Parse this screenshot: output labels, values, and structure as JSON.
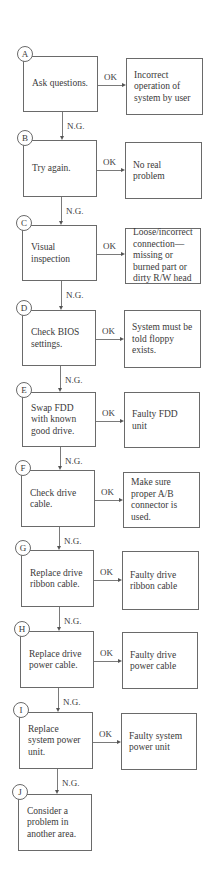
{
  "diagram": {
    "ok_label": "OK",
    "ng_label": "N.G.",
    "steps": [
      {
        "id": "A",
        "action": "Ask questions.",
        "result": "Incorrect operation of system by user"
      },
      {
        "id": "B",
        "action": "Try again.",
        "result": "No real problem"
      },
      {
        "id": "C",
        "action": "Visual inspection",
        "result": "Loose/incorrect connection—missing or burned part or dirty R/W head"
      },
      {
        "id": "D",
        "action": "Check BIOS settings.",
        "result": "System must be told floppy exists."
      },
      {
        "id": "E",
        "action": "Swap FDD with known good drive.",
        "result": "Faulty FDD unit"
      },
      {
        "id": "F",
        "action": "Check drive cable.",
        "result": "Make sure proper A/B connector is used."
      },
      {
        "id": "G",
        "action": "Replace drive ribbon cable.",
        "result": "Faulty drive ribbon cable"
      },
      {
        "id": "H",
        "action": "Replace drive power cable.",
        "result": "Faulty drive power cable"
      },
      {
        "id": "I",
        "action": "Replace system power unit.",
        "result": "Faulty system power unit"
      },
      {
        "id": "J",
        "action": "Consider a problem in another area."
      }
    ]
  }
}
